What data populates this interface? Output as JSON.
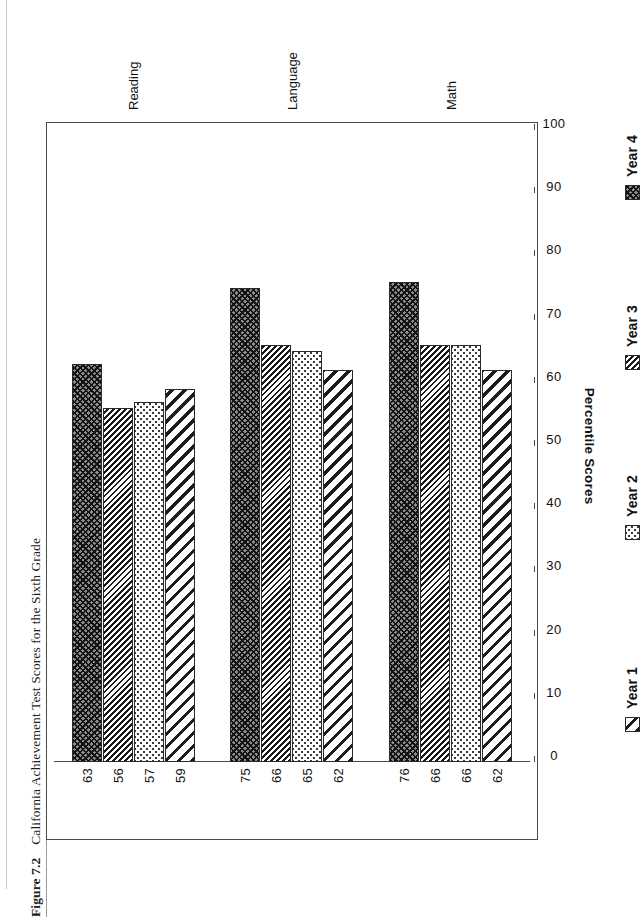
{
  "caption": {
    "figure_number": "Figure 7.2",
    "title": "California Achievement Test Scores for the Sixth Grade"
  },
  "chart_data": {
    "type": "bar",
    "orientation": "horizontal",
    "title": "California Achievement Test Scores for the Sixth Grade",
    "xlabel": "Percentile Scores",
    "ylabel": "",
    "xlim": [
      0,
      100
    ],
    "grid": false,
    "legend_position": "bottom",
    "categories": [
      "Reading",
      "Language",
      "Math"
    ],
    "series": [
      {
        "name": "Year 1",
        "values": [
          59,
          62,
          62
        ],
        "pattern": "diagonal-stripe-wide",
        "color": "#1c1c1c"
      },
      {
        "name": "Year 2",
        "values": [
          57,
          65,
          66
        ],
        "pattern": "fine-dots",
        "color": "#3a3a3a"
      },
      {
        "name": "Year 3",
        "values": [
          56,
          66,
          66
        ],
        "pattern": "diagonal-stripe-dense",
        "color": "#1a1a1a"
      },
      {
        "name": "Year 4",
        "values": [
          63,
          75,
          76
        ],
        "pattern": "dark-crosshatch",
        "color": "#8c8c8c"
      }
    ],
    "tick_labels": [
      "0",
      "10",
      "20",
      "30",
      "40",
      "50",
      "60",
      "70",
      "80",
      "90",
      "100"
    ],
    "tick_values": [
      0,
      10,
      20,
      30,
      40,
      50,
      60,
      70,
      80,
      90,
      100
    ],
    "data_labels": {
      "Reading": {
        "Year 1": "59",
        "Year 2": "57",
        "Year 3": "56",
        "Year 4": "63"
      },
      "Language": {
        "Year 1": "62",
        "Year 2": "65",
        "Year 3": "66",
        "Year 4": "75"
      },
      "Math": {
        "Year 1": "62",
        "Year 2": "66",
        "Year 3": "66",
        "Year 4": "76"
      }
    }
  },
  "axis": {
    "value_axis_title": "Percentile Scores",
    "tick_labels": [
      "0",
      "10",
      "20",
      "30",
      "40",
      "50",
      "60",
      "70",
      "80",
      "90",
      "100"
    ]
  },
  "category_labels": [
    "Reading",
    "Language",
    "Math"
  ],
  "legend": {
    "items": [
      {
        "label": "Year 1"
      },
      {
        "label": "Year 2"
      },
      {
        "label": "Year 3"
      },
      {
        "label": "Year 4"
      }
    ]
  },
  "colors": {
    "frame": "#4a4a4a",
    "bar_outline": "#2b2b2b",
    "text": "#111111",
    "background": "#ffffff"
  }
}
